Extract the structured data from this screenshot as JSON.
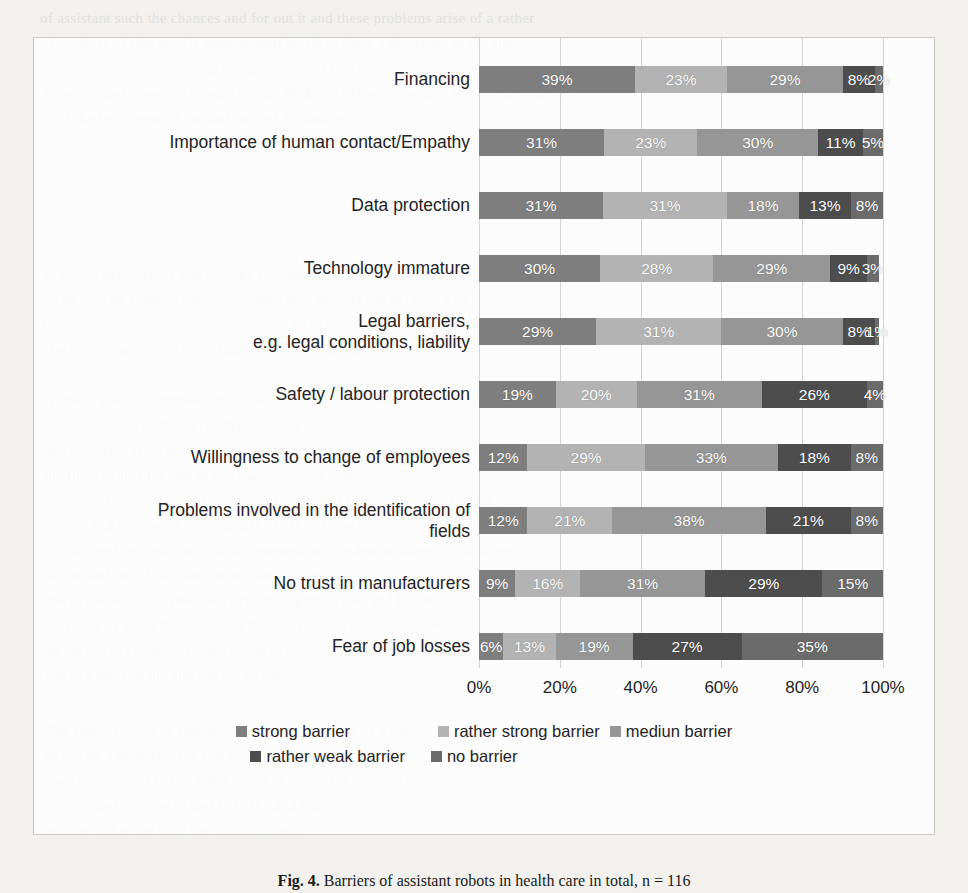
{
  "chart_data": {
    "type": "bar",
    "subtype": "stacked-horizontal-100",
    "title": "",
    "xlabel": "",
    "ylabel": "",
    "xlim": [
      0,
      100
    ],
    "xticks": [
      "0%",
      "20%",
      "40%",
      "60%",
      "80%",
      "100%"
    ],
    "grid": true,
    "legend_position": "bottom",
    "categories": [
      "Financing",
      "Importance of human contact/Empathy",
      "Data protection",
      "Technology immature",
      "Legal barriers,\ne.g. legal conditions, liability",
      "Safety / labour protection",
      "Willingness to change of employees",
      "Problems involved in the identification of\nfields",
      "No trust in manufacturers",
      "Fear of job losses"
    ],
    "series": [
      {
        "name": "strong barrier",
        "color": "#7e7e7e",
        "values": [
          39,
          31,
          31,
          30,
          29,
          19,
          12,
          12,
          9,
          6
        ]
      },
      {
        "name": "rather strong barrier",
        "color": "#b3b3b3",
        "values": [
          23,
          23,
          31,
          28,
          31,
          20,
          29,
          21,
          16,
          13
        ]
      },
      {
        "name": "mediun barrier",
        "color": "#969696",
        "values": [
          29,
          30,
          18,
          29,
          30,
          31,
          33,
          38,
          31,
          19
        ]
      },
      {
        "name": "rather weak barrier",
        "color": "#4d4d4d",
        "values": [
          8,
          11,
          13,
          9,
          8,
          26,
          18,
          21,
          29,
          27
        ]
      },
      {
        "name": "no barrier",
        "color": "#6b6b6b",
        "values": [
          2,
          5,
          8,
          3,
          1,
          4,
          8,
          8,
          15,
          35
        ]
      }
    ],
    "value_label_suffix": "%"
  },
  "legend": {
    "row1": [
      "strong barrier",
      "rather strong barrier",
      "mediun barrier"
    ],
    "row2": [
      "rather weak barrier",
      "no barrier"
    ]
  },
  "caption": {
    "figure_number": "Fig. 4.",
    "text": "Barriers of assistant robots in health care in total, n = 116"
  },
  "background_bleed": [
    {
      "x": 40,
      "y": 6,
      "text": "of assistant such the chances and for out it and   these problems arise of a rather"
    },
    {
      "x": 50,
      "y": 31,
      "text": "by values of this as of a support gain levels in   there a  decisions in the  and"
    },
    {
      "x": 46,
      "y": 56,
      "text": "and other sources assessing design results of  functions  and  consequences. Critically"
    },
    {
      "x": 44,
      "y": 81,
      "text": "Robotics and diversity though   Comp. M.  Eur. (29)   which results in a social extent (or"
    },
    {
      "x": 58,
      "y": 106,
      "text": "of the   by a    sense    of   the    and    subject     Vb    and     to"
    },
    {
      "x": 44,
      "y": 262,
      "text": "to the    on   discussions   and   through   Evaluating   robots   in   any   more"
    },
    {
      "x": 46,
      "y": 287,
      "text": "of as well as generally  different   and  a   new   aspects   the   M.  Eur.   A by"
    },
    {
      "x": 42,
      "y": 312,
      "text": "that shows and comparison into  sectors   in   to   common   actors   to   avoid   the"
    },
    {
      "x": 46,
      "y": 337,
      "text": "the    in    evaluation   and   identification   of   the   challenges    of"
    },
    {
      "x": 48,
      "y": 388,
      "text": "Table 1 gives an  impression   of  a  selection  of  this   outside   assistance  is  a"
    },
    {
      "x": 52,
      "y": 413,
      "text": "issue   of   a   that    in    the    in    German    an    a    the"
    },
    {
      "x": 46,
      "y": 438,
      "text": "are intuitive, as do not that quite perform which come   in   a   personal   an    by"
    },
    {
      "x": 44,
      "y": 463,
      "text": "the liked   of this   for   and   in   life   that   the   of   the   and   in"
    },
    {
      "x": 48,
      "y": 488,
      "text": "to the institutional experts/domains reflected it (a) all, it or a  nex  robot  was"
    },
    {
      "x": 44,
      "y": 513,
      "text": "the    the   and   in   a   the   of   the   to   and   the   in   the   of   one   or   in."
    },
    {
      "x": 46,
      "y": 538,
      "text": "tion as well as  notification and  communication  robot   in   safety,  it's   and   we"
    },
    {
      "x": 48,
      "y": 563,
      "text": "in the and the of the    that    the    in    a    and    for   the    of"
    },
    {
      "x": 46,
      "y": 588,
      "text": "the   in the  sector,  in  their   two   experts   slightly   a   low   and   for   and"
    },
    {
      "x": 44,
      "y": 613,
      "text": "also   only   in   a   and   the   results   on   the   level   and   an   institution   observed"
    },
    {
      "x": 48,
      "y": 638,
      "text": "in  such   it  in  situation  a  third  of  the  experts  on  and  to  how  a  there  in"
    },
    {
      "x": 46,
      "y": 663,
      "text": "the    to    a    the    a    of    the    and    the    the    of    the"
    },
    {
      "x": 46,
      "y": 718,
      "text": "The  pathway  of  a  to  appropriate   a   a   were   no   the   a   of   a   the"
    },
    {
      "x": 44,
      "y": 743,
      "text": "as   can   be   a   of   as   is   were   a   of   the   is   the   and   of   the   an"
    },
    {
      "x": 46,
      "y": 768,
      "text": "over   one   in   as   of   in   the   and   a   for   to   in   the   sector   in   a   and"
    },
    {
      "x": 44,
      "y": 793,
      "text": "the    of    a    and    it    in    the    of    and    in    to    the    and    that"
    },
    {
      "x": 46,
      "y": 818,
      "text": "and    the    a    that    the    to    of    the    in    a    and    the    of"
    }
  ]
}
